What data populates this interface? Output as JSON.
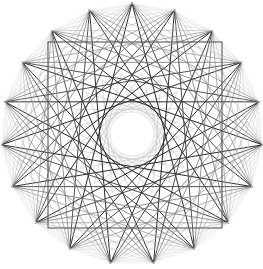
{
  "canvas": {
    "width": 263,
    "height": 269,
    "background": "#ffffff"
  },
  "figure": {
    "center_x": 132,
    "center_y": 134,
    "radius": 131,
    "vertex_count": 19,
    "center_hole_radius": 14,
    "outer_circle": {
      "stroke": "#e8e8e8",
      "stroke_width": 0.8,
      "radius": 128
    },
    "square": {
      "left": 48,
      "top": 42,
      "right": 222,
      "bottom": 228,
      "stroke": "#5a5a5a",
      "stroke_width": 1.1
    },
    "colors": {
      "dark": "#2b2b2b",
      "mid_dark": "#4a4a4a",
      "mid": "#7a7a7a",
      "light": "#a8a8a8",
      "faint": "#cfcfcf",
      "very_faint": "#e4e4e4",
      "background": "#ffffff"
    },
    "chord_sets": [
      {
        "name": "outer-star-skip-8",
        "skip": 8,
        "stroke": "#2b2b2b",
        "stroke_width": 1.0
      },
      {
        "name": "outer-star-skip-7",
        "skip": 7,
        "stroke": "#3d3d3d",
        "stroke_width": 0.9
      },
      {
        "name": "mid-star-skip-6",
        "skip": 6,
        "stroke": "#6e6e6e",
        "stroke_width": 0.75
      },
      {
        "name": "mid-star-skip-5",
        "skip": 5,
        "stroke": "#8d8d8d",
        "stroke_width": 0.7
      },
      {
        "name": "inner-star-skip-4",
        "skip": 4,
        "stroke": "#b4b4b4",
        "stroke_width": 0.6
      },
      {
        "name": "inner-star-skip-3",
        "skip": 3,
        "stroke": "#cbcbcb",
        "stroke_width": 0.55
      },
      {
        "name": "inner-star-skip-2",
        "skip": 2,
        "stroke": "#dcdcdc",
        "stroke_width": 0.5
      },
      {
        "name": "rim-polygon-skip-1",
        "skip": 1,
        "stroke": "#ececec",
        "stroke_width": 0.5
      }
    ],
    "inner_rings": [
      {
        "name": "inner-ring-a",
        "radius": 62,
        "vertex_count": 19,
        "skip": 7,
        "stroke": "#bdbdbd",
        "stroke_width": 0.5,
        "rotation": 9
      },
      {
        "name": "inner-ring-b",
        "radius": 45,
        "vertex_count": 19,
        "skip": 6,
        "stroke": "#cccccc",
        "stroke_width": 0.5,
        "rotation": 18
      },
      {
        "name": "inner-ring-c",
        "radius": 32,
        "vertex_count": 19,
        "skip": 5,
        "stroke": "#d6d6d6",
        "stroke_width": 0.45,
        "rotation": 27
      }
    ]
  }
}
